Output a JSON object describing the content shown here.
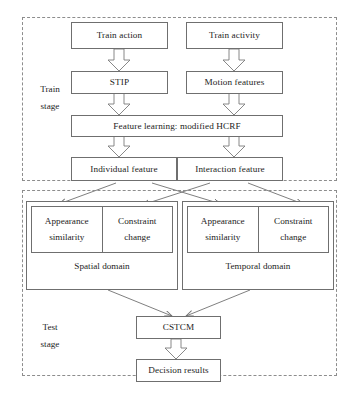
{
  "diagram": {
    "stages": [
      {
        "id": "train",
        "label_line1": "Train",
        "label_line2": "stage"
      },
      {
        "id": "test",
        "label_line1": "Test",
        "label_line2": "stage"
      }
    ],
    "nodes": {
      "train_action": "Train action",
      "train_activity": "Train activity",
      "stip": "STIP",
      "motion_features": "Motion features",
      "feature_learning": "Feature learning: modified HCRF",
      "individual_feature": "Individual feature",
      "interaction_feature": "Interaction feature",
      "cstcm": "CSTCM",
      "decision_results": "Decision results"
    },
    "domains": [
      {
        "id": "spatial",
        "caption": "Spatial domain",
        "cells": [
          {
            "line1": "Appearance",
            "line2": "similarity"
          },
          {
            "line1": "Constraint",
            "line2": "change"
          }
        ]
      },
      {
        "id": "temporal",
        "caption": "Temporal domain",
        "cells": [
          {
            "line1": "Appearance",
            "line2": "similarity"
          },
          {
            "line1": "Constraint",
            "line2": "change"
          }
        ]
      }
    ],
    "colors": {
      "box_border": "#6f6f6f",
      "panel_border": "#8d8d8d",
      "text": "#1d1d1d",
      "arrow": "#707070",
      "background": "#ffffff"
    }
  }
}
